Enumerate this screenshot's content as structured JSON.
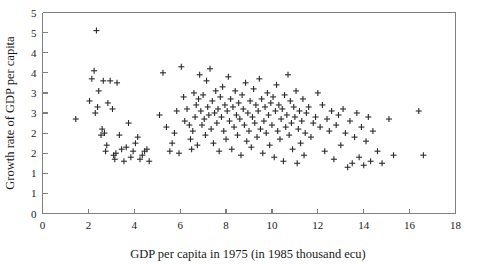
{
  "chart": {
    "type": "scatter",
    "title": "",
    "marker": "plus",
    "marker_color": "#2b2b2b",
    "axis_color": "#808080",
    "background": "#ffffff"
  },
  "chart_data": {
    "type": "scatter",
    "title": "",
    "subtitle": "",
    "xlabel": "GDP per capita in 1975 (in 1985 thousand ecu)",
    "ylabel": "Growth rate of GDP per capita",
    "xlim": [
      0,
      18
    ],
    "ylim": [
      0,
      5
    ],
    "xticks": [
      0,
      2,
      4,
      6,
      8,
      10,
      12,
      14,
      16,
      18
    ],
    "xticklabels": [
      "0",
      "2",
      "4",
      "6",
      "8",
      "10",
      "12",
      "14",
      "16",
      "18"
    ],
    "yticks": [
      0,
      0.5,
      1,
      1.5,
      2,
      2.5,
      3,
      3.5,
      4,
      4.5,
      5
    ],
    "yticklabels": [
      "0",
      "1",
      "1",
      "2",
      "2",
      "3",
      "3",
      "4",
      "4",
      "5"
    ],
    "yticklabel_values": [
      0,
      0.5,
      1,
      1.5,
      2,
      2.5,
      3,
      3.5,
      4,
      4.5
    ],
    "grid": false,
    "legend": false,
    "legend_position": "none",
    "series": [
      {
        "name": "regions",
        "points": [
          [
            1.45,
            2.35
          ],
          [
            2.05,
            2.8
          ],
          [
            2.15,
            3.35
          ],
          [
            2.25,
            3.55
          ],
          [
            2.3,
            2.5
          ],
          [
            2.35,
            4.55
          ],
          [
            2.4,
            2.65
          ],
          [
            2.45,
            3.05
          ],
          [
            2.55,
            1.95
          ],
          [
            2.6,
            2.1
          ],
          [
            2.65,
            3.3
          ],
          [
            2.7,
            2.0
          ],
          [
            2.75,
            1.55
          ],
          [
            2.8,
            1.7
          ],
          [
            2.85,
            2.75
          ],
          [
            2.95,
            3.3
          ],
          [
            3.05,
            2.6
          ],
          [
            3.1,
            1.45
          ],
          [
            3.15,
            1.35
          ],
          [
            3.2,
            1.5
          ],
          [
            3.25,
            3.25
          ],
          [
            3.35,
            1.95
          ],
          [
            3.45,
            1.6
          ],
          [
            3.55,
            1.3
          ],
          [
            3.65,
            1.65
          ],
          [
            3.75,
            2.25
          ],
          [
            3.85,
            1.4
          ],
          [
            3.95,
            1.55
          ],
          [
            4.05,
            1.75
          ],
          [
            4.15,
            1.9
          ],
          [
            4.25,
            1.35
          ],
          [
            4.35,
            1.45
          ],
          [
            4.45,
            1.55
          ],
          [
            4.55,
            1.6
          ],
          [
            4.65,
            1.3
          ],
          [
            5.1,
            2.45
          ],
          [
            5.25,
            3.5
          ],
          [
            5.4,
            2.15
          ],
          [
            5.55,
            1.55
          ],
          [
            5.65,
            1.75
          ],
          [
            5.75,
            2.0
          ],
          [
            5.85,
            2.55
          ],
          [
            5.95,
            1.5
          ],
          [
            6.05,
            3.65
          ],
          [
            6.15,
            2.9
          ],
          [
            6.2,
            2.3
          ],
          [
            6.3,
            2.6
          ],
          [
            6.4,
            2.2
          ],
          [
            6.45,
            1.85
          ],
          [
            6.5,
            1.6
          ],
          [
            6.55,
            2.05
          ],
          [
            6.6,
            3.0
          ],
          [
            6.65,
            2.4
          ],
          [
            6.7,
            2.7
          ],
          [
            6.75,
            1.7
          ],
          [
            6.8,
            2.85
          ],
          [
            6.85,
            3.45
          ],
          [
            6.9,
            2.55
          ],
          [
            6.95,
            2.2
          ],
          [
            7.0,
            2.95
          ],
          [
            7.05,
            2.35
          ],
          [
            7.1,
            1.95
          ],
          [
            7.15,
            3.3
          ],
          [
            7.2,
            2.65
          ],
          [
            7.25,
            2.45
          ],
          [
            7.3,
            3.6
          ],
          [
            7.35,
            2.1
          ],
          [
            7.4,
            2.8
          ],
          [
            7.45,
            1.75
          ],
          [
            7.5,
            2.5
          ],
          [
            7.55,
            3.05
          ],
          [
            7.6,
            2.25
          ],
          [
            7.65,
            2.6
          ],
          [
            7.7,
            1.55
          ],
          [
            7.75,
            2.9
          ],
          [
            7.8,
            2.4
          ],
          [
            7.85,
            3.15
          ],
          [
            7.9,
            2.05
          ],
          [
            7.95,
            2.7
          ],
          [
            8.0,
            1.85
          ],
          [
            8.05,
            2.55
          ],
          [
            8.1,
            3.4
          ],
          [
            8.15,
            2.3
          ],
          [
            8.2,
            2.85
          ],
          [
            8.25,
            1.6
          ],
          [
            8.3,
            2.65
          ],
          [
            8.35,
            2.15
          ],
          [
            8.4,
            3.05
          ],
          [
            8.45,
            2.45
          ],
          [
            8.5,
            1.95
          ],
          [
            8.55,
            2.75
          ],
          [
            8.6,
            2.35
          ],
          [
            8.65,
            1.45
          ],
          [
            8.7,
            2.95
          ],
          [
            8.75,
            2.6
          ],
          [
            8.8,
            2.2
          ],
          [
            8.85,
            3.25
          ],
          [
            8.9,
            1.8
          ],
          [
            8.95,
            2.5
          ],
          [
            9.0,
            2.05
          ],
          [
            9.05,
            2.8
          ],
          [
            9.1,
            1.65
          ],
          [
            9.15,
            2.4
          ],
          [
            9.2,
            3.1
          ],
          [
            9.25,
            2.25
          ],
          [
            9.3,
            2.7
          ],
          [
            9.35,
            1.9
          ],
          [
            9.4,
            2.55
          ],
          [
            9.45,
            3.35
          ],
          [
            9.5,
            2.1
          ],
          [
            9.55,
            2.85
          ],
          [
            9.6,
            1.5
          ],
          [
            9.65,
            2.3
          ],
          [
            9.7,
            2.65
          ],
          [
            9.75,
            2.0
          ],
          [
            9.8,
            3.0
          ],
          [
            9.85,
            2.45
          ],
          [
            9.9,
            1.7
          ],
          [
            9.95,
            2.75
          ],
          [
            10.0,
            2.2
          ],
          [
            10.05,
            2.9
          ],
          [
            10.1,
            1.4
          ],
          [
            10.15,
            2.55
          ],
          [
            10.2,
            3.2
          ],
          [
            10.25,
            2.05
          ],
          [
            10.3,
            2.7
          ],
          [
            10.35,
            1.85
          ],
          [
            10.4,
            2.35
          ],
          [
            10.45,
            2.6
          ],
          [
            10.5,
            1.3
          ],
          [
            10.55,
            2.95
          ],
          [
            10.6,
            2.15
          ],
          [
            10.65,
            2.45
          ],
          [
            10.7,
            3.45
          ],
          [
            10.75,
            1.95
          ],
          [
            10.8,
            2.8
          ],
          [
            10.85,
            2.25
          ],
          [
            10.9,
            1.6
          ],
          [
            10.95,
            2.65
          ],
          [
            11.0,
            2.4
          ],
          [
            11.05,
            3.05
          ],
          [
            11.1,
            1.25
          ],
          [
            11.15,
            2.1
          ],
          [
            11.2,
            2.55
          ],
          [
            11.25,
            1.75
          ],
          [
            11.3,
            2.3
          ],
          [
            11.35,
            2.85
          ],
          [
            11.4,
            1.45
          ],
          [
            11.45,
            2.0
          ],
          [
            11.5,
            2.5
          ],
          [
            11.6,
            2.65
          ],
          [
            11.7,
            1.9
          ],
          [
            11.8,
            2.25
          ],
          [
            11.9,
            2.4
          ],
          [
            12.0,
            3.0
          ],
          [
            12.1,
            2.15
          ],
          [
            12.2,
            2.7
          ],
          [
            12.3,
            1.55
          ],
          [
            12.4,
            2.35
          ],
          [
            12.5,
            2.05
          ],
          [
            12.6,
            2.55
          ],
          [
            12.7,
            1.35
          ],
          [
            12.8,
            2.2
          ],
          [
            12.9,
            2.45
          ],
          [
            13.0,
            1.7
          ],
          [
            13.1,
            2.6
          ],
          [
            13.2,
            2.0
          ],
          [
            13.3,
            1.15
          ],
          [
            13.4,
            2.3
          ],
          [
            13.5,
            1.25
          ],
          [
            13.6,
            1.9
          ],
          [
            13.7,
            2.5
          ],
          [
            13.8,
            1.4
          ],
          [
            13.9,
            2.15
          ],
          [
            14.0,
            1.2
          ],
          [
            14.1,
            1.8
          ],
          [
            14.2,
            2.4
          ],
          [
            14.3,
            1.3
          ],
          [
            14.4,
            2.05
          ],
          [
            14.6,
            1.55
          ],
          [
            14.8,
            1.25
          ],
          [
            15.1,
            2.35
          ],
          [
            15.3,
            1.45
          ],
          [
            16.4,
            2.55
          ],
          [
            16.6,
            1.45
          ]
        ]
      }
    ]
  },
  "axes": {
    "x_title": "GDP per capita in 1975 (in 1985 thousand ecu)",
    "y_title": "Growth rate of GDP per capita"
  }
}
